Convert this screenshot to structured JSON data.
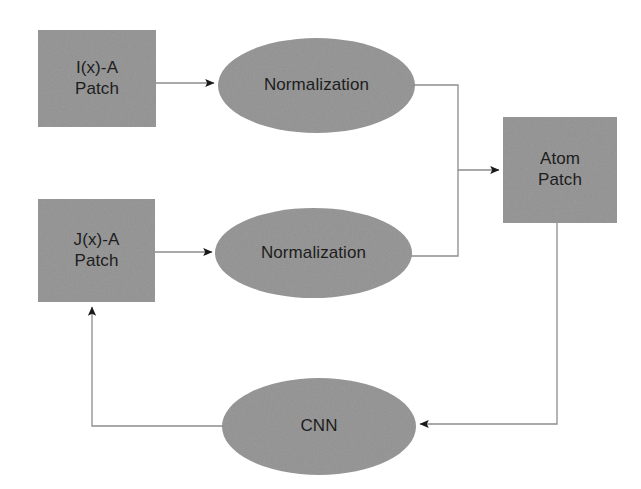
{
  "diagram": {
    "style": {
      "node_fill": "#9a9a9a",
      "node_fill_dark": "#8f8f8f",
      "edge_color": "#8d8d8d",
      "arrow_color": "#1a1a1a",
      "text_color": "#1d1d1d",
      "background": "#ffffff"
    },
    "nodes": [
      {
        "id": "ix-a-patch",
        "shape": "rect",
        "label_lines": [
          "I(x)-A",
          "Patch"
        ],
        "x": 38,
        "y": 30,
        "w": 118,
        "h": 97
      },
      {
        "id": "normalization-top",
        "shape": "ellipse",
        "label_lines": [
          "Normalization"
        ],
        "x": 218,
        "y": 38,
        "w": 197,
        "h": 95
      },
      {
        "id": "atom-patch",
        "shape": "rect",
        "label_lines": [
          "Atom",
          "Patch"
        ],
        "x": 503,
        "y": 117,
        "w": 114,
        "h": 106
      },
      {
        "id": "jx-a-patch",
        "shape": "rect",
        "label_lines": [
          "J(x)-A",
          "Patch"
        ],
        "x": 38,
        "y": 199,
        "w": 117,
        "h": 103
      },
      {
        "id": "normalization-bottom",
        "shape": "ellipse",
        "label_lines": [
          "Normalization"
        ],
        "x": 215,
        "y": 208,
        "w": 197,
        "h": 90
      },
      {
        "id": "cnn",
        "shape": "ellipse",
        "label_lines": [
          "CNN"
        ],
        "x": 222,
        "y": 378,
        "w": 194,
        "h": 97
      }
    ],
    "edges": [
      {
        "id": "e1",
        "from": "ix-a-patch",
        "to": "normalization-top",
        "label": ""
      },
      {
        "id": "e2",
        "from": "jx-a-patch",
        "to": "normalization-bottom",
        "label": ""
      },
      {
        "id": "e3",
        "from": "normalization-top",
        "to": "atom-patch",
        "label": ""
      },
      {
        "id": "e4",
        "from": "normalization-bottom",
        "to": "atom-patch",
        "label": ""
      },
      {
        "id": "e5",
        "from": "atom-patch",
        "to": "cnn",
        "label": ""
      },
      {
        "id": "e6",
        "from": "cnn",
        "to": "jx-a-patch",
        "label": ""
      }
    ]
  }
}
